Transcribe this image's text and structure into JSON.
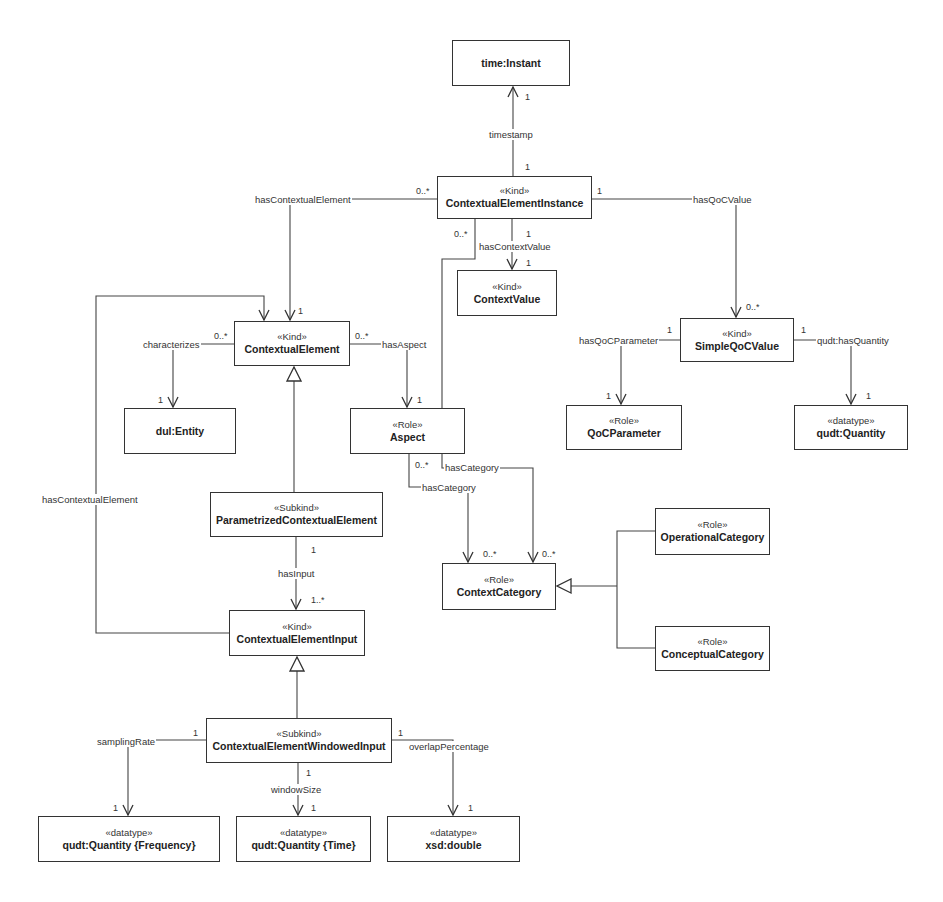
{
  "diagram": {
    "type": "UML class diagram",
    "classes": {
      "time_instant": {
        "stereotype": "",
        "name": "time:Instant"
      },
      "cei": {
        "stereotype": "«Kind»",
        "name": "ContextualElementInstance"
      },
      "context_value": {
        "stereotype": "«Kind»",
        "name": "ContextValue"
      },
      "simple_qoc_value": {
        "stereotype": "«Kind»",
        "name": "SimpleQoCValue"
      },
      "qoc_parameter": {
        "stereotype": "«Role»",
        "name": "QoCParameter"
      },
      "qudt_quantity": {
        "stereotype": "«datatype»",
        "name": "qudt:Quantity"
      },
      "contextual_element": {
        "stereotype": "«Kind»",
        "name": "ContextualElement"
      },
      "dul_entity": {
        "stereotype": "",
        "name": "dul:Entity"
      },
      "aspect": {
        "stereotype": "«Role»",
        "name": "Aspect"
      },
      "parametrized_ce": {
        "stereotype": "«Subkind»",
        "name": "ParametrizedContextualElement"
      },
      "context_category": {
        "stereotype": "«Role»",
        "name": "ContextCategory"
      },
      "operational_category": {
        "stereotype": "«Role»",
        "name": "OperationalCategory"
      },
      "conceptual_category": {
        "stereotype": "«Role»",
        "name": "ConceptualCategory"
      },
      "cei_input": {
        "stereotype": "«Kind»",
        "name": "ContextualElementInput"
      },
      "cewi": {
        "stereotype": "«Subkind»",
        "name": "ContextualElementWindowedInput"
      },
      "qty_frequency": {
        "stereotype": "«datatype»",
        "name": "qudt:Quantity {Frequency}"
      },
      "qty_time": {
        "stereotype": "«datatype»",
        "name": "qudt:Quantity {Time}"
      },
      "xsd_double": {
        "stereotype": "«datatype»",
        "name": "xsd:double"
      }
    },
    "associations": {
      "timestamp": {
        "label": "timestamp",
        "source_mult": "1",
        "target_mult": "1"
      },
      "has_contextual_element_top": {
        "label": "hasContextualElement",
        "source_mult": "0..*",
        "target_mult": "1"
      },
      "has_context_value": {
        "label": "hasContextValue",
        "source_mult": "1",
        "target_mult": "1"
      },
      "has_qoc_value": {
        "label": "hasQoCValue",
        "source_mult": "1",
        "target_mult": "0..*"
      },
      "has_category_cei": {
        "label": "hasCategory",
        "source_mult": "0..*",
        "target_mult": "0..*"
      },
      "has_qoc_parameter": {
        "label": "hasQoCParameter",
        "source_mult": "1",
        "target_mult": "1"
      },
      "qudt_has_quantity": {
        "label": "qudt:hasQuantity",
        "source_mult": "1",
        "target_mult": "1"
      },
      "characterizes": {
        "label": "characterizes",
        "source_mult": "0..*",
        "target_mult": "1"
      },
      "has_aspect": {
        "label": "hasAspect",
        "source_mult": "0..*",
        "target_mult": "1"
      },
      "has_category_aspect": {
        "label": "hasCategory",
        "source_mult": "0..*",
        "target_mult": "0..*"
      },
      "has_input": {
        "label": "hasInput",
        "source_mult": "1",
        "target_mult": "1..*"
      },
      "has_contextual_element_left": {
        "label": "hasContextualElement"
      },
      "sampling_rate": {
        "label": "samplingRate",
        "source_mult": "1",
        "target_mult": "1"
      },
      "window_size": {
        "label": "windowSize",
        "source_mult": "1",
        "target_mult": "1"
      },
      "overlap_percentage": {
        "label": "overlapPercentage",
        "source_mult": "1",
        "target_mult": "1"
      }
    }
  }
}
